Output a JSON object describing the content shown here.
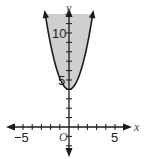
{
  "chart_data": {
    "type": "area",
    "title": "",
    "curve": {
      "form": "y = a*x^2 + 4",
      "vertex": [
        0,
        4
      ],
      "a": 1.2,
      "boundary": "solid"
    },
    "shading": "above curve",
    "xlabel": "x",
    "ylabel": "y",
    "origin_label": "O",
    "xlim": [
      -6.5,
      6.5
    ],
    "ylim": [
      -3,
      12
    ],
    "x_tick_labels": [
      "-5",
      "5"
    ],
    "y_tick_labels": [
      "5",
      "10"
    ],
    "grid": false,
    "colors": {
      "shade": "#cfcfcf",
      "line": "#1a1a1a"
    }
  },
  "labels": {
    "x_axis": "x",
    "y_axis": "y",
    "origin": "O",
    "x_neg5": "−5",
    "x_pos5": "5",
    "y_5": "5",
    "y_10": "10"
  }
}
